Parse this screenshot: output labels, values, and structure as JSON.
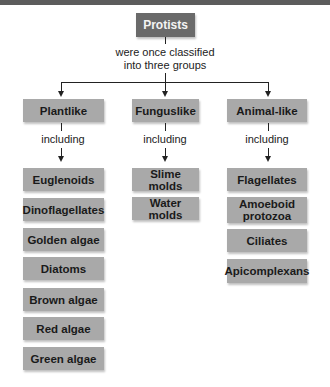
{
  "root": {
    "label": "Protists"
  },
  "root_connector_text": [
    "were once classified",
    "into three groups"
  ],
  "groups": [
    {
      "label": "Plantlike",
      "connector_text": "including",
      "items": [
        "Euglenoids",
        "Dinoflagellates",
        "Golden algae",
        "Diatoms",
        "Brown algae",
        "Red algae",
        "Green algae"
      ]
    },
    {
      "label": "Funguslike",
      "connector_text": "including",
      "items": [
        "Slime molds",
        "Water molds"
      ]
    },
    {
      "label": "Animal-like",
      "connector_text": "including",
      "items": [
        "Flagellates",
        "Amoeboid protozoa",
        "Ciliates",
        "Apicomplexans"
      ]
    }
  ],
  "colors": {
    "root_box": "#6a6a6a",
    "group_box": "#a9a9a9",
    "item_box": "#a9a9a9",
    "lines": "#222222",
    "top_band": "#5c5c5c"
  }
}
